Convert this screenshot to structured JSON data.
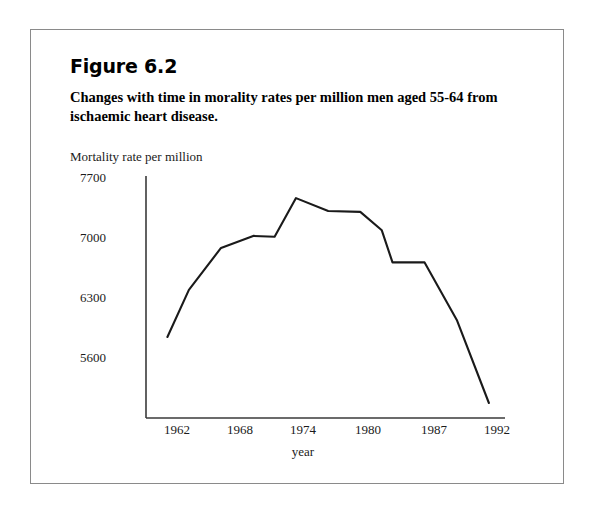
{
  "figure": {
    "number": "Figure 6.2",
    "caption": "Changes with time in morality rates per million men aged 55-64 from ischaemic heart disease."
  },
  "chart_data": {
    "type": "line",
    "title": "Changes with time in morality rates per million men aged 55-64 from ischaemic heart disease.",
    "xlabel": "year",
    "ylabel": "Mortality rate per million",
    "x": [
      1961,
      1963,
      1966,
      1969,
      1971,
      1973,
      1976,
      1979,
      1981,
      1982,
      1985,
      1988,
      1991
    ],
    "values": [
      5845,
      6395,
      6885,
      7025,
      7015,
      7465,
      7315,
      7305,
      7090,
      6715,
      6715,
      6045,
      5075
    ],
    "xticks": [
      "1962",
      "1968",
      "1974",
      "1980",
      "1987",
      "1992"
    ],
    "xtick_values": [
      1962,
      1968,
      1974,
      1980,
      1987,
      1992
    ],
    "yticks": [
      "7700",
      "7000",
      "6300",
      "5600"
    ],
    "ytick_values": [
      7700,
      7000,
      6300,
      5600
    ],
    "xlim": [
      1959,
      1992.5
    ],
    "ylim": [
      4850,
      7780
    ],
    "grid": false,
    "legend": false,
    "line_color": "#1a1a1a",
    "axis_color": "#3a3a3a"
  }
}
